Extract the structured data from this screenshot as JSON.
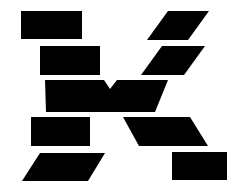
{
  "artwork": {
    "title": "Stylized letter K logo",
    "letterform": "K",
    "style": "fragmented geometric blocks",
    "background_color": "#ffffff",
    "shape_color": "#000000",
    "canvas": {
      "width": 249,
      "height": 195
    },
    "shape_count": 9,
    "shapes": [
      {
        "id": "stem-block-upper",
        "name": "top-left-rectangle",
        "kind": "rectangle",
        "color": "#000000",
        "points": "21,11 82,11 82,39 21,39"
      },
      {
        "id": "stem-block-second",
        "name": "second-left-rectangle",
        "kind": "rectangle",
        "color": "#000000",
        "points": "40,46 100,46 100,75 40,75"
      },
      {
        "id": "arm-block-upper",
        "name": "top-right-parallelogram",
        "kind": "parallelogram",
        "color": "#000000",
        "points": "168,11 209,11 188,40 147,40"
      },
      {
        "id": "arm-block-second",
        "name": "second-right-parallelogram",
        "kind": "parallelogram",
        "color": "#000000",
        "points": "162,46 205,46 184,75 141,75"
      },
      {
        "id": "junction-block",
        "name": "center-junction-wedge",
        "kind": "notched-polygon",
        "color": "#000000",
        "points": "45,80 104,80 110,89 117,80 168,80 155,112 46,112"
      },
      {
        "id": "stem-block-third",
        "name": "third-left-rectangle",
        "kind": "rectangle",
        "color": "#000000",
        "points": "31,117 90,117 90,146 31,146"
      },
      {
        "id": "leg-block-upper",
        "name": "lower-right-parallelogram",
        "kind": "parallelogram",
        "color": "#000000",
        "points": "123,117 190,117 208,146 139,146"
      },
      {
        "id": "stem-block-lower",
        "name": "bottom-left-parallelogram",
        "kind": "parallelogram",
        "color": "#000000",
        "points": "40,153 105,153 88,181 22,181"
      },
      {
        "id": "leg-block-lower",
        "name": "bottom-right-rectangle",
        "kind": "rectangle",
        "color": "#000000",
        "points": "172,152 227,152 227,180 172,180"
      }
    ]
  }
}
